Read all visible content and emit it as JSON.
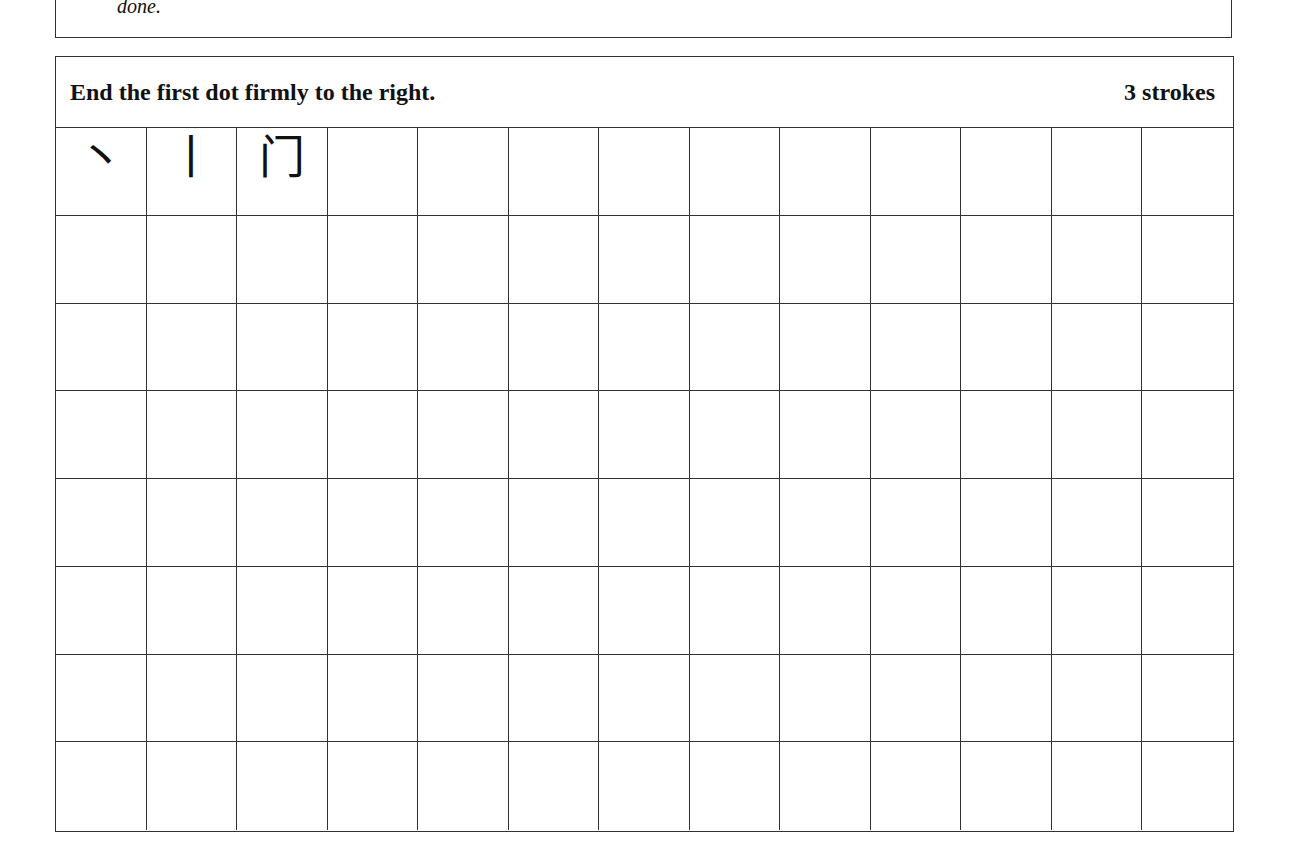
{
  "previous_section": {
    "text_tail": "done."
  },
  "exercise": {
    "instruction": "End the first dot firmly to the right.",
    "stroke_count": "3 strokes",
    "stroke_sequence": [
      "丶",
      "门",
      "门"
    ],
    "stroke_sequence_glyphs": [
      "丶",
      "丨",
      "门"
    ],
    "grid": {
      "columns": 13,
      "rows": 8
    }
  }
}
